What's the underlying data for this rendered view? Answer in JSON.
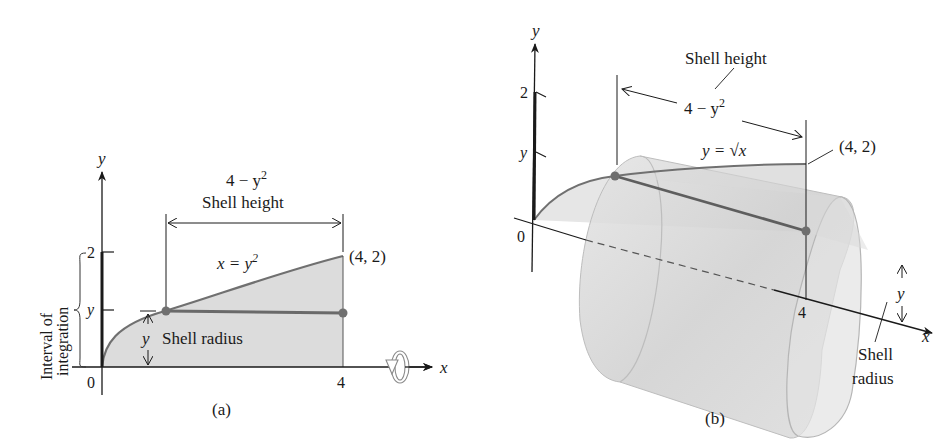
{
  "figure_a": {
    "caption": "(a)",
    "axis_x_label": "x",
    "axis_y_label": "y",
    "origin_label": "0",
    "tick_y_2": "2",
    "tick_y_y": "y",
    "tick_x_4": "4",
    "interval_label_line1": "Interval of",
    "interval_label_line2": "integration",
    "shell_height_expr_base": "4 − y",
    "shell_height_expr_exp": "2",
    "shell_height_label": "Shell height",
    "curve_label_base": "x = y",
    "curve_label_exp": "2",
    "point_label": "(4, 2)",
    "radius_var": "y",
    "shell_radius_label": "Shell radius",
    "rotation_icon": "rotation-about-x-axis"
  },
  "figure_b": {
    "caption": "(b)",
    "axis_x_label": "x",
    "axis_y_label": "y",
    "origin_label": "0",
    "tick_y_2": "2",
    "tick_y_y": "y",
    "tick_x_4": "4",
    "shell_height_label": "Shell height",
    "shell_height_expr_base": "4 − y",
    "shell_height_expr_exp": "2",
    "curve_label": "y = √x",
    "point_label": "(4, 2)",
    "radius_var": "y",
    "shell_radius_line1": "Shell",
    "shell_radius_line2": "radius"
  },
  "colors": {
    "region_fill": "#d9d9d9",
    "curve": "#6e6e6e",
    "point": "#707070",
    "cylinder_fill": "#d4d4d4",
    "axis": "#1a1a1a"
  }
}
